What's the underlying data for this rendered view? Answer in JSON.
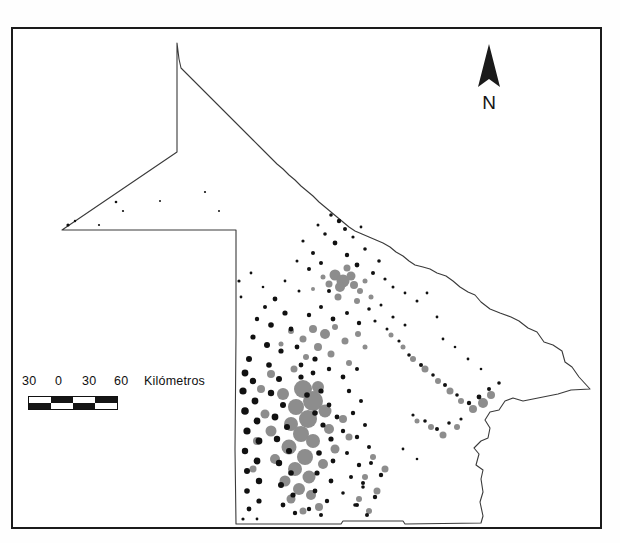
{
  "map": {
    "title": "",
    "region_outline_name": "state-boundary",
    "background_color": "#ffffff",
    "frame_color": "#1b1b1b",
    "patch_colors": {
      "dark": "#111111",
      "gray": "#8d8d8d"
    },
    "layers": [
      {
        "name": "state-boundary",
        "stroke": "#333333"
      },
      {
        "name": "land-cover-patches-dark",
        "fill": "#111111"
      },
      {
        "name": "land-cover-patches-gray",
        "fill": "#8d8d8d"
      }
    ]
  },
  "north_arrow": {
    "label": "N",
    "icon": "north-arrow-icon"
  },
  "scale_bar": {
    "units_label": "Kilómetros",
    "tick_labels": [
      "30",
      "0",
      "30",
      "60"
    ],
    "segments": 4,
    "segment_span_km": 30,
    "total_span_km": 90,
    "style": "checkerboard"
  }
}
